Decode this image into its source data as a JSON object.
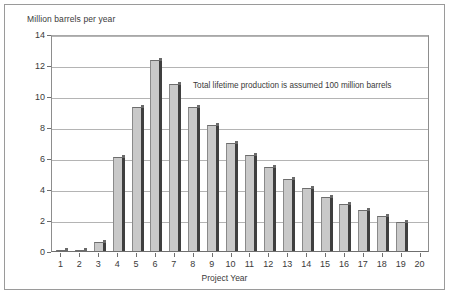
{
  "chart_data": {
    "type": "bar",
    "title": "",
    "subtitle": "",
    "xlabel": "Project Year",
    "ylabel": "Million barrels per year",
    "ylim": [
      0,
      14
    ],
    "yticks": [
      0,
      2,
      4,
      6,
      8,
      10,
      12,
      14
    ],
    "grid": true,
    "legend": null,
    "categories": [
      "1",
      "2",
      "3",
      "4",
      "5",
      "6",
      "7",
      "8",
      "9",
      "10",
      "11",
      "12",
      "13",
      "14",
      "15",
      "16",
      "17",
      "18",
      "19",
      "20"
    ],
    "values": [
      0.05,
      0.05,
      0.55,
      6.05,
      9.3,
      12.3,
      10.75,
      9.3,
      8.1,
      7.0,
      6.2,
      5.4,
      4.65,
      4.05,
      3.5,
      3.05,
      2.65,
      2.25,
      1.9,
      0
    ],
    "annotations": [
      {
        "text": "Total lifetime production is assumed 100 million barrels"
      }
    ],
    "series": [
      {
        "name": "Annual production",
        "values": [
          0.05,
          0.05,
          0.55,
          6.05,
          9.3,
          12.3,
          10.75,
          9.3,
          8.1,
          7.0,
          6.2,
          5.4,
          4.65,
          4.05,
          3.5,
          3.05,
          2.65,
          2.25,
          1.9,
          0
        ]
      }
    ],
    "colors": {
      "bar_face": "#c9c9c9",
      "bar_side": "#3f3f3f",
      "gridline": "#b4b4b4",
      "axis": "#6f6f6f",
      "frame": "#9a9a9a",
      "text": "#3a3a3a",
      "background": "#ffffff"
    }
  }
}
